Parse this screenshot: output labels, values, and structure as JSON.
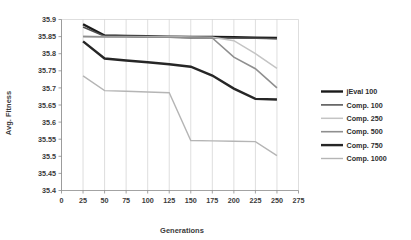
{
  "chart_data": {
    "type": "line",
    "title": "",
    "xlabel": "Generations",
    "ylabel": "Avg. Fitness",
    "xlim": [
      0,
      275
    ],
    "ylim": [
      35.4,
      35.9
    ],
    "xticks": [
      0,
      25,
      50,
      75,
      100,
      125,
      150,
      175,
      200,
      225,
      250,
      275
    ],
    "yticks": [
      35.4,
      35.45,
      35.5,
      35.55,
      35.6,
      35.65,
      35.7,
      35.75,
      35.8,
      35.85,
      35.9
    ],
    "xtick_labels": [
      "0",
      "25",
      "50",
      "75",
      "100",
      "125",
      "150",
      "175",
      "200",
      "225",
      "250",
      "275"
    ],
    "ytick_labels": [
      "35.4",
      "35.45",
      "35.5",
      "35.55",
      "35.6",
      "35.65",
      "35.7",
      "35.75",
      "35.8",
      "35.85",
      "35.9"
    ],
    "grid": true,
    "grid_axis": "x",
    "legend_position": "right",
    "x": [
      25,
      50,
      75,
      100,
      125,
      150,
      175,
      200,
      225,
      250
    ],
    "series": [
      {
        "name": "jEval 100",
        "color": "#1a1a1a",
        "width": 2.4,
        "values": [
          35.886,
          35.853,
          35.852,
          35.851,
          35.85,
          35.849,
          35.849,
          35.848,
          35.847,
          35.846
        ]
      },
      {
        "name": "Comp. 100",
        "color": "#4d4d4d",
        "width": 1.5,
        "values": [
          35.878,
          35.851,
          35.85,
          35.849,
          35.848,
          35.847,
          35.847,
          35.846,
          35.845,
          35.844
        ]
      },
      {
        "name": "Comp. 250",
        "color": "#c4c4c4",
        "width": 1.5,
        "values": [
          35.851,
          35.85,
          35.85,
          35.85,
          35.85,
          35.849,
          35.848,
          35.838,
          35.8,
          35.757
        ]
      },
      {
        "name": "Comp. 500",
        "color": "#8f8f8f",
        "width": 1.6,
        "values": [
          35.85,
          35.849,
          35.849,
          35.848,
          35.848,
          35.847,
          35.846,
          35.79,
          35.756,
          35.7
        ]
      },
      {
        "name": "Comp. 750",
        "color": "#262626",
        "width": 2.4,
        "values": [
          35.836,
          35.786,
          35.78,
          35.775,
          35.769,
          35.762,
          35.736,
          35.698,
          35.668,
          35.666
        ]
      },
      {
        "name": "Comp. 1000",
        "color": "#b5b5b5",
        "width": 1.4,
        "values": [
          35.735,
          35.692,
          35.69,
          35.688,
          35.686,
          35.546,
          35.545,
          35.544,
          35.543,
          35.502
        ]
      }
    ]
  },
  "legend": {
    "entries": [
      {
        "label": "jEval 100"
      },
      {
        "label": "Comp. 100"
      },
      {
        "label": "Comp. 250"
      },
      {
        "label": "Comp. 500"
      },
      {
        "label": "Comp. 750"
      },
      {
        "label": "Comp. 1000"
      }
    ]
  }
}
